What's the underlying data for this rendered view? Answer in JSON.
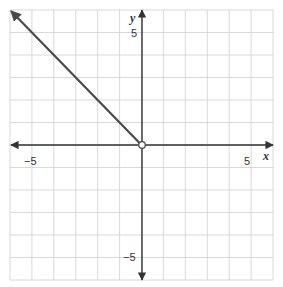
{
  "chart_data": {
    "type": "line",
    "title": "",
    "xlabel": "x",
    "ylabel": "y",
    "xlim": [
      -6,
      6
    ],
    "ylim": [
      -6,
      6
    ],
    "grid": true,
    "grid_step": 1,
    "x_tick_labels": [
      {
        "value": -5,
        "label": "−5"
      },
      {
        "value": 5,
        "label": "5"
      }
    ],
    "y_tick_labels": [
      {
        "value": 5,
        "label": "5"
      },
      {
        "value": -5,
        "label": "−5"
      }
    ],
    "series": [
      {
        "name": "ray y = -x, x < 0",
        "kind": "ray",
        "x": [
          0,
          -6
        ],
        "y": [
          0,
          6
        ],
        "start_point": {
          "x": 0,
          "y": 0,
          "marker": "open-circle"
        },
        "arrow_at_end": true,
        "color": "#444444"
      }
    ],
    "legend": null
  },
  "colors": {
    "grid": "#cfcfcf",
    "axis": "#333333",
    "ray": "#4a4a4a",
    "background": "#ffffff"
  },
  "labels": {
    "x_axis": "x",
    "y_axis": "y",
    "x_neg5": "−5",
    "x_pos5": "5",
    "y_pos5": "5",
    "y_neg5": "−5"
  }
}
